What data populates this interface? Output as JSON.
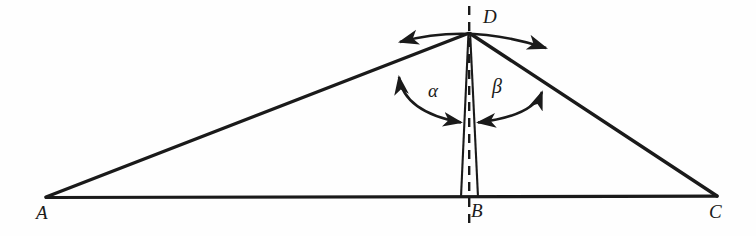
{
  "figure": {
    "kind": "geometry-diagram",
    "background_color": "#fefefe",
    "stroke_color": "#1a1a1a",
    "vertices": [
      {
        "name": "A",
        "label": "A",
        "x": 46,
        "y": 197
      },
      {
        "name": "B",
        "label": "B",
        "x": 469,
        "y": 197
      },
      {
        "name": "C",
        "label": "C",
        "x": 717,
        "y": 196
      },
      {
        "name": "D",
        "label": "D",
        "x": 469,
        "y": 33
      }
    ],
    "angles": [
      {
        "name": "alpha",
        "label": "α",
        "at": "D",
        "between": [
          "DA",
          "DB-left"
        ]
      },
      {
        "name": "beta",
        "label": "β",
        "at": "D",
        "between": [
          "DB-right",
          "DC"
        ]
      }
    ],
    "segments": [
      {
        "name": "side-AD",
        "from": "A",
        "to": "D",
        "style": "solid"
      },
      {
        "name": "side-DC",
        "from": "D",
        "to": "C",
        "style": "solid"
      },
      {
        "name": "base-AC",
        "from": "A",
        "to": "C",
        "style": "solid"
      },
      {
        "name": "cevian-left",
        "from": "D",
        "to": "B",
        "style": "solid"
      },
      {
        "name": "cevian-right",
        "from": "D",
        "to": "B",
        "style": "solid"
      },
      {
        "name": "axis-vertical",
        "from": "D",
        "to": "B",
        "style": "dashed"
      }
    ],
    "arrows": [
      {
        "name": "apex-sweep-arc",
        "heads": "both",
        "position": "above D"
      },
      {
        "name": "alpha-arc",
        "heads": "both",
        "position": "inside angle alpha"
      },
      {
        "name": "beta-arc",
        "heads": "both",
        "position": "inside angle beta"
      }
    ]
  }
}
